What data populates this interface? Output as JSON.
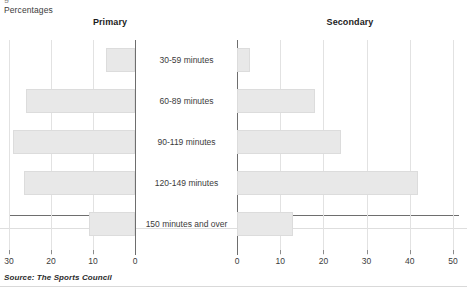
{
  "figure": {
    "units_label": "Percentages",
    "top_cropped_text": "g",
    "source": "Source: The Sports Council",
    "panels": [
      {
        "id": "primary",
        "title": "Primary"
      },
      {
        "id": "secondary",
        "title": "Secondary"
      }
    ]
  },
  "chart_data": {
    "type": "bar",
    "orientation": "horizontal",
    "layout": "back-to-back butterfly (two mirrored panels sharing centred category labels)",
    "title": "",
    "subtitle": "",
    "xlabel": "Percentages",
    "ylabel": "",
    "grid": true,
    "legend_position": "none (panel headings used instead)",
    "categories": [
      "30-59 minutes",
      "60-89 minutes",
      "90-119 minutes",
      "120-149 minutes",
      "150 minutes and over"
    ],
    "series": [
      {
        "name": "Primary",
        "values": [
          7,
          26,
          29,
          26.5,
          11
        ],
        "axis": "left",
        "direction": "right-to-left",
        "xlim": [
          0,
          30
        ],
        "ticks": [
          30,
          20,
          10,
          0
        ],
        "tick_labels": [
          "30",
          "20",
          "10",
          "0"
        ]
      },
      {
        "name": "Secondary",
        "values": [
          3,
          18,
          24,
          42,
          13
        ],
        "axis": "right",
        "direction": "left-to-right",
        "xlim": [
          0,
          50
        ],
        "ticks": [
          0,
          10,
          20,
          30,
          40,
          50
        ],
        "tick_labels": [
          "0",
          "10",
          "20",
          "30",
          "40",
          "50"
        ]
      }
    ],
    "colors": {
      "bar_fill": "#e8e8e8",
      "bar_edge": "#dcdcdc",
      "grid": "#e2e2e2",
      "axis": "#6e6e6e",
      "text": "#3b3b3b"
    }
  }
}
